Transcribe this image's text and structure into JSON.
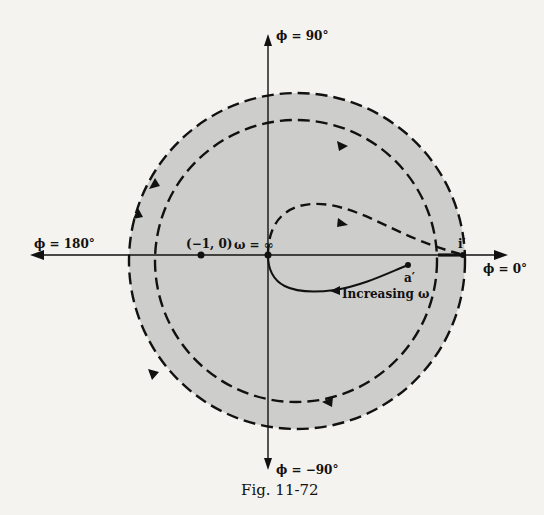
{
  "figure": {
    "caption": "Fig. 11-72",
    "colors": {
      "background": "#f4f3ef",
      "shading": "#cdcdcb",
      "ink": "#111111"
    }
  },
  "axes": {
    "top_label": "ϕ = 90°",
    "bottom_label": "ϕ = −90°",
    "left_label": "ϕ = 180°",
    "right_label": "ϕ = 0°"
  },
  "points": {
    "critical_point": "(−1, 0)",
    "origin_label": "ω = ∞",
    "a_prime": "a′",
    "i_prime": "i′"
  },
  "annotations": {
    "increasing_omega": "Increasing ω"
  },
  "contours": {
    "outer_circle": {
      "style": "dashed",
      "direction": "counterclockwise"
    },
    "inner_circle": {
      "style": "dashed",
      "direction": "clockwise"
    },
    "loop_upper": {
      "style": "dashed"
    },
    "loop_lower": {
      "style": "solid"
    }
  }
}
